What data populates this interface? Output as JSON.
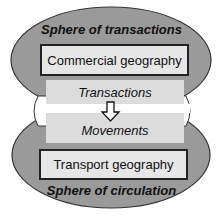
{
  "diagram": {
    "top_sphere": {
      "label": "Sphere of transactions",
      "box": "Commercial geography"
    },
    "middle": {
      "upper": "Transactions",
      "lower": "Movements",
      "arrow": "down-arrow-icon"
    },
    "bottom_sphere": {
      "label": "Sphere of circulation",
      "box": "Transport geography"
    },
    "colors": {
      "ellipse_fill": "#9a9a9a",
      "ellipse_stroke": "#333333",
      "box_fill": "#e6e6e6",
      "panel_fill": "#dcdcdc",
      "band": "#ffffff"
    }
  }
}
